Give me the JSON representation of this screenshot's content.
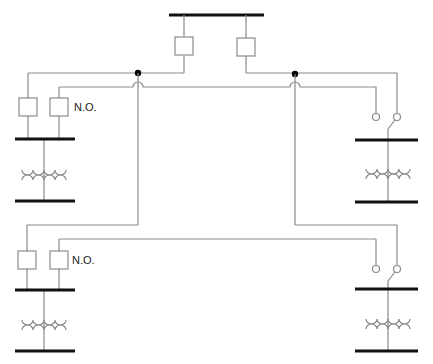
{
  "diagram": {
    "type": "electrical single-line diagram",
    "colors": {
      "line": "#8a8a8a",
      "bus": "#111111",
      "node": "#000000"
    },
    "labels": {
      "no_upper": "N.O.",
      "no_lower": "N.O."
    },
    "components": {
      "main_bus": 1,
      "source_breakers": 2,
      "junction_nodes": 2,
      "substations": 4,
      "feeder_breakers": 4,
      "load_break_switches": 2,
      "transformers": 4
    }
  }
}
